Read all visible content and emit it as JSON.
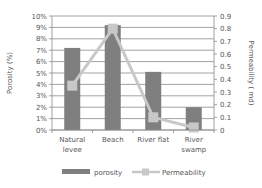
{
  "chart_data": {
    "type": "bar",
    "title": "",
    "categories": [
      "Natural levee",
      "Beach",
      "River flat",
      "River swamp"
    ],
    "category_lines": [
      [
        "Natural",
        "levee"
      ],
      [
        "Beach"
      ],
      [
        "River flat"
      ],
      [
        "River",
        "swamp"
      ]
    ],
    "series": [
      {
        "name": "porosity",
        "type": "bar",
        "axis": "left",
        "unit": "%",
        "values": [
          7.2,
          9.2,
          5.1,
          2.0
        ],
        "color": "#7f7f7f"
      },
      {
        "name": "Permeability",
        "type": "line",
        "axis": "right",
        "unit": "md",
        "values": [
          0.35,
          0.8,
          0.1,
          0.02
        ],
        "color": "#c8c8c8"
      }
    ],
    "ylabel": "Porosity (%)",
    "ylabel_right": "Permeability ( md)",
    "ylim": [
      0,
      10
    ],
    "ylim_right": [
      0,
      0.9
    ],
    "yticks": [
      "0%",
      "1%",
      "2%",
      "3%",
      "4%",
      "5%",
      "6%",
      "7%",
      "8%",
      "9%",
      "10%"
    ],
    "yticks_right": [
      "0",
      "0.1",
      "0.2",
      "0.3",
      "0.4",
      "0.5",
      "0.6",
      "0.7",
      "0.8",
      "0.9"
    ],
    "grid": true,
    "legend_position": "bottom"
  }
}
